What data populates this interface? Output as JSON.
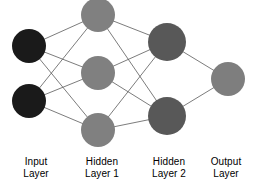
{
  "diagram": {
    "type": "neural-network-architecture",
    "background_color": "#ffffff",
    "edge_color": "#5a5a5a",
    "edge_width": 0.8,
    "canvas": {
      "width": 254,
      "height": 190
    },
    "layers": [
      {
        "id": "input",
        "label_line1": "Input",
        "label_line2": "Layer",
        "label_style": "emph",
        "node_color": "#1a1a1a",
        "node_radius": 17,
        "node_count": 2,
        "nodes": [
          {
            "cx": 29,
            "cy": 46
          },
          {
            "cx": 29,
            "cy": 101
          }
        ]
      },
      {
        "id": "hidden1",
        "label_line1": "Hidden",
        "label_line2": "Layer 1",
        "label_style": "muted",
        "node_color": "#808080",
        "node_radius": 17,
        "node_count": 3,
        "nodes": [
          {
            "cx": 98,
            "cy": 15
          },
          {
            "cx": 98,
            "cy": 73
          },
          {
            "cx": 98,
            "cy": 130
          }
        ]
      },
      {
        "id": "hidden2",
        "label_line1": "Hidden",
        "label_line2": "Layer 2",
        "label_style": "emph",
        "node_color": "#585858",
        "node_radius": 19,
        "node_count": 2,
        "nodes": [
          {
            "cx": 167,
            "cy": 42
          },
          {
            "cx": 167,
            "cy": 116
          }
        ]
      },
      {
        "id": "output",
        "label_line1": "Output",
        "label_line2": "Layer",
        "label_style": "muted",
        "node_color": "#7e7e7e",
        "node_radius": 17,
        "node_count": 1,
        "nodes": [
          {
            "cx": 228,
            "cy": 79
          }
        ]
      }
    ],
    "connections": "fully-connected-between-adjacent-layers"
  }
}
